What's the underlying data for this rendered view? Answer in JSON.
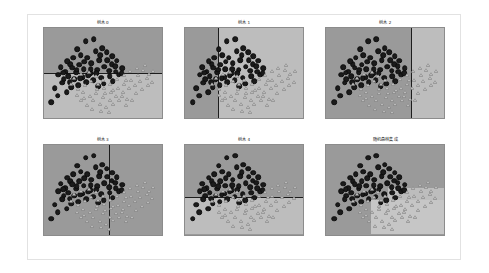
{
  "figure": {
    "background_color": "#ffffff",
    "border_color": "#e2e2e2",
    "layout": "2x3 grid of decision boundary scatter plots"
  },
  "colors": {
    "region_class_0": "#9a9a9a",
    "region_class_1": "#bdbdbd",
    "boundary_line": "#1d1d1d",
    "marker_class_0": "#1b1b1b",
    "marker_class_1": "#b9b9b9",
    "axes_border": "#8c8c8c"
  },
  "panels": [
    {
      "id": "panel-0",
      "title": "树木 0",
      "boundary": {
        "type": "horizontal",
        "position_pct": 50.0
      },
      "regions": [
        {
          "name": "upper",
          "class": 0,
          "x": 0,
          "y": 0,
          "w": 100,
          "h": 50,
          "color": "#9a9a9a"
        },
        {
          "name": "lower",
          "class": 1,
          "x": 0,
          "y": 50,
          "w": 100,
          "h": 50,
          "color": "#bdbdbd"
        }
      ]
    },
    {
      "id": "panel-1",
      "title": "树木 1",
      "boundary": {
        "type": "vertical",
        "position_pct": 28.0
      },
      "regions": [
        {
          "name": "left",
          "class": 0,
          "x": 0,
          "y": 0,
          "w": 28,
          "h": 100,
          "color": "#9a9a9a"
        },
        {
          "name": "right",
          "class": 1,
          "x": 28,
          "y": 0,
          "w": 72,
          "h": 100,
          "color": "#bdbdbd"
        }
      ]
    },
    {
      "id": "panel-2",
      "title": "树木 2",
      "boundary": {
        "type": "vertical",
        "position_pct": 72.0
      },
      "regions": [
        {
          "name": "left",
          "class": 0,
          "x": 0,
          "y": 0,
          "w": 72,
          "h": 100,
          "color": "#9a9a9a"
        },
        {
          "name": "right",
          "class": 1,
          "x": 72,
          "y": 0,
          "w": 28,
          "h": 100,
          "color": "#bdbdbd"
        }
      ]
    },
    {
      "id": "panel-3",
      "title": "树木 3",
      "boundary": {
        "type": "vertical",
        "position_pct": 55.0
      },
      "regions": [
        {
          "name": "left",
          "class": 0,
          "x": 0,
          "y": 0,
          "w": 55,
          "h": 100,
          "color": "#9a9a9a"
        },
        {
          "name": "right",
          "class": 1,
          "x": 55,
          "y": 0,
          "w": 45,
          "h": 100,
          "color": "#9a9a9a"
        }
      ]
    },
    {
      "id": "panel-4",
      "title": "树木 4",
      "boundary": {
        "type": "horizontal",
        "position_pct": 58.0
      },
      "regions": [
        {
          "name": "upper",
          "class": 0,
          "x": 0,
          "y": 0,
          "w": 100,
          "h": 58,
          "color": "#9a9a9a"
        },
        {
          "name": "lower",
          "class": 1,
          "x": 0,
          "y": 58,
          "w": 100,
          "h": 42,
          "color": "#bdbdbd"
        }
      ]
    },
    {
      "id": "panel-5",
      "title": "随机森林集成",
      "boundary": {
        "type": "stepped",
        "position_pct": null
      },
      "regions": [
        {
          "name": "background",
          "class": 0,
          "x": 0,
          "y": 0,
          "w": 100,
          "h": 100,
          "color": "#9a9a9a"
        },
        {
          "name": "step-right",
          "class": 1,
          "x": 52,
          "y": 48,
          "w": 48,
          "h": 52,
          "color": "#bdbdbd"
        },
        {
          "name": "step-lower",
          "class": 1,
          "x": 38,
          "y": 62,
          "w": 62,
          "h": 38,
          "color": "#c6c6c6"
        }
      ]
    }
  ],
  "chart_data": {
    "type": "scatter",
    "title": "",
    "xlabel": "",
    "ylabel": "",
    "xlim": [
      0,
      100
    ],
    "ylim": [
      0,
      100
    ],
    "grid": false,
    "legend": "none",
    "n_panels": 6,
    "series": [
      {
        "name": "class-0-circles",
        "marker": "circle",
        "color": "#1b1b1b",
        "points": [
          [
            18.5,
            48.5
          ],
          [
            9.5,
            67.0
          ],
          [
            6.5,
            82.5
          ],
          [
            14.5,
            43.5
          ],
          [
            22.5,
            40.5
          ],
          [
            28.5,
            23.5
          ],
          [
            35.5,
            14.5
          ],
          [
            42.5,
            12.5
          ],
          [
            31.5,
            30.0
          ],
          [
            25.0,
            33.0
          ],
          [
            20.0,
            37.0
          ],
          [
            12.5,
            52.0
          ],
          [
            17.0,
            57.0
          ],
          [
            24.0,
            44.0
          ],
          [
            30.0,
            41.0
          ],
          [
            37.0,
            33.0
          ],
          [
            44.0,
            25.5
          ],
          [
            49.5,
            22.5
          ],
          [
            53.5,
            27.0
          ],
          [
            58.0,
            31.5
          ],
          [
            47.0,
            35.5
          ],
          [
            40.5,
            39.0
          ],
          [
            34.0,
            46.0
          ],
          [
            27.5,
            49.0
          ],
          [
            21.0,
            53.5
          ],
          [
            15.5,
            61.0
          ],
          [
            26.0,
            57.0
          ],
          [
            33.0,
            54.5
          ],
          [
            39.5,
            50.5
          ],
          [
            45.5,
            46.5
          ],
          [
            51.5,
            43.0
          ],
          [
            57.5,
            40.0
          ],
          [
            62.0,
            36.5
          ],
          [
            66.5,
            44.5
          ],
          [
            63.5,
            52.0
          ],
          [
            56.0,
            53.5
          ],
          [
            49.0,
            55.0
          ],
          [
            42.0,
            58.0
          ],
          [
            36.0,
            60.5
          ],
          [
            29.5,
            63.5
          ],
          [
            23.5,
            66.0
          ],
          [
            19.5,
            71.5
          ],
          [
            12.0,
            75.0
          ],
          [
            55.5,
            47.5
          ],
          [
            61.0,
            48.5
          ],
          [
            44.5,
            50.0
          ],
          [
            38.0,
            52.5
          ],
          [
            31.0,
            56.0
          ],
          [
            66.0,
            50.5
          ],
          [
            58.5,
            59.0
          ],
          [
            51.0,
            62.0
          ],
          [
            46.0,
            64.5
          ],
          [
            40.0,
            45.5
          ],
          [
            34.5,
            37.5
          ],
          [
            28.0,
            46.5
          ],
          [
            22.0,
            60.0
          ],
          [
            16.5,
            49.5
          ],
          [
            48.0,
            30.5
          ],
          [
            54.0,
            36.0
          ],
          [
            60.5,
            42.5
          ]
        ]
      },
      {
        "name": "class-1-triangles",
        "marker": "triangle",
        "color": "#b9b9b9",
        "points": [
          [
            26.0,
            55.5
          ],
          [
            32.0,
            51.5
          ],
          [
            38.5,
            49.0
          ],
          [
            44.0,
            53.0
          ],
          [
            50.0,
            57.5
          ],
          [
            56.5,
            62.0
          ],
          [
            62.5,
            57.0
          ],
          [
            68.0,
            52.5
          ],
          [
            73.5,
            48.0
          ],
          [
            79.0,
            44.5
          ],
          [
            84.5,
            47.0
          ],
          [
            89.0,
            51.5
          ],
          [
            93.0,
            47.5
          ],
          [
            86.0,
            41.5
          ],
          [
            80.0,
            52.0
          ],
          [
            74.0,
            57.5
          ],
          [
            68.5,
            62.5
          ],
          [
            63.0,
            67.0
          ],
          [
            57.0,
            71.0
          ],
          [
            51.5,
            66.5
          ],
          [
            46.0,
            62.0
          ],
          [
            40.5,
            58.5
          ],
          [
            35.0,
            63.0
          ],
          [
            29.0,
            67.5
          ],
          [
            23.0,
            62.5
          ],
          [
            33.5,
            71.5
          ],
          [
            39.0,
            75.0
          ],
          [
            44.5,
            72.0
          ],
          [
            50.5,
            76.5
          ],
          [
            56.0,
            80.0
          ],
          [
            61.5,
            76.0
          ],
          [
            67.0,
            71.5
          ],
          [
            72.5,
            67.0
          ],
          [
            78.0,
            72.5
          ],
          [
            83.5,
            68.0
          ],
          [
            88.5,
            63.5
          ],
          [
            42.0,
            80.5
          ],
          [
            47.5,
            84.5
          ],
          [
            53.0,
            88.0
          ],
          [
            58.5,
            84.0
          ],
          [
            36.5,
            85.0
          ],
          [
            31.5,
            80.0
          ],
          [
            64.0,
            80.5
          ],
          [
            69.5,
            85.0
          ],
          [
            75.0,
            80.0
          ],
          [
            28.5,
            74.5
          ],
          [
            34.0,
            78.0
          ],
          [
            45.0,
            68.0
          ],
          [
            52.0,
            72.5
          ],
          [
            59.0,
            68.5
          ],
          [
            66.0,
            75.0
          ],
          [
            71.0,
            79.0
          ],
          [
            48.5,
            92.0
          ],
          [
            55.5,
            93.5
          ],
          [
            41.0,
            90.0
          ],
          [
            77.5,
            63.0
          ],
          [
            82.0,
            58.5
          ],
          [
            87.5,
            55.0
          ],
          [
            92.0,
            59.5
          ],
          [
            70.0,
            58.0
          ]
        ]
      }
    ]
  }
}
